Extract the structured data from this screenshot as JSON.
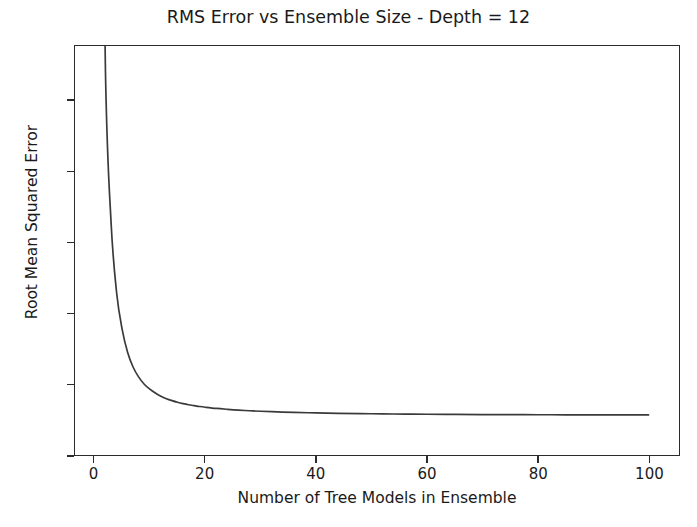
{
  "chart_data": {
    "type": "line",
    "title": "RMS Error vs Ensemble Size - Depth = 12",
    "xlabel": "Number of Tree Models in Ensemble",
    "ylabel": "Root Mean Squared Error",
    "xlim": [
      -3.5,
      105.5
    ],
    "ylim": [
      0.0,
      5.78
    ],
    "xticks": [
      0,
      20,
      40,
      60,
      80,
      100
    ],
    "xtick_labels": [
      "0",
      "20",
      "40",
      "60",
      "80",
      "100"
    ],
    "yticks": [
      0,
      1,
      2,
      3,
      4,
      5
    ],
    "ytick_labels": [
      "0",
      "1",
      "2",
      "3",
      "4",
      "5"
    ],
    "grid": false,
    "legend": null,
    "line_color": "#3a3a3a",
    "line_width": 1.7,
    "background_color": "#ffffff",
    "axes_edge_color": "#2b2b2b",
    "note": "Monotonically decreasing 1/sqrt(n)-like decay; curve is clipped at the top of the axes near n=1.8 where RMSE exceeds 5.78, and flattens to an asymptote near 0.57.",
    "series": [
      {
        "name": "RMSE vs ensemble size",
        "x": [
          1,
          2,
          3,
          4,
          5,
          6,
          7,
          8,
          9,
          10,
          11,
          12,
          13,
          14,
          15,
          16,
          17,
          18,
          19,
          20,
          22,
          24,
          26,
          28,
          30,
          33,
          36,
          40,
          44,
          48,
          52,
          56,
          60,
          65,
          70,
          75,
          80,
          85,
          90,
          95,
          100
        ],
        "y": [
          11.2,
          5.4,
          3.3,
          2.3,
          1.78,
          1.45,
          1.24,
          1.1,
          1.0,
          0.93,
          0.875,
          0.83,
          0.795,
          0.768,
          0.745,
          0.726,
          0.71,
          0.697,
          0.685,
          0.675,
          0.658,
          0.645,
          0.634,
          0.625,
          0.618,
          0.609,
          0.602,
          0.595,
          0.589,
          0.585,
          0.581,
          0.578,
          0.5755,
          0.5735,
          0.5715,
          0.5702,
          0.569,
          0.5682,
          0.5675,
          0.5668,
          0.5662
        ]
      }
    ]
  }
}
